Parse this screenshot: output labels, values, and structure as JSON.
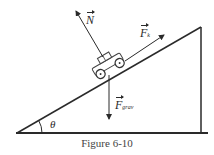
{
  "figure": {
    "caption": "Figure 6-10",
    "labels": {
      "normal": {
        "symbol": "N",
        "subscript": ""
      },
      "kinetic": {
        "symbol": "F",
        "subscript": "k"
      },
      "gravity": {
        "symbol": "F",
        "subscript": "grav"
      },
      "angle": "θ"
    },
    "colors": {
      "line": "#2a2a2a",
      "background": "#ffffff"
    }
  }
}
